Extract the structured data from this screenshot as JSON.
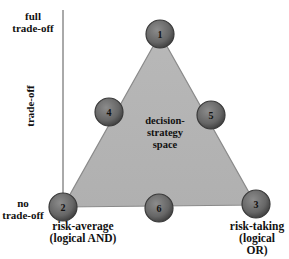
{
  "diagram": {
    "axis": {
      "label": "trade-off",
      "top_label": "full trade-off",
      "bottom_label": "no trade-off"
    },
    "region_label": [
      "decision-",
      "strategy",
      "space"
    ],
    "colors": {
      "triangle_fill": "#b3b3b3",
      "triangle_stroke": "#8a8a8a",
      "node_fill": "#6e6e6e",
      "node_stroke": "#3a3a3a",
      "axis_line": "#555555"
    },
    "nodes": [
      {
        "id": "1",
        "label": "1",
        "position": "top"
      },
      {
        "id": "2",
        "label": "2",
        "position": "bottom-left",
        "caption": [
          "risk-average",
          "(logical AND)"
        ]
      },
      {
        "id": "3",
        "label": "3",
        "position": "bottom-right",
        "caption": [
          "risk-taking",
          "(logical",
          "OR)"
        ]
      },
      {
        "id": "4",
        "label": "4",
        "position": "left-edge"
      },
      {
        "id": "5",
        "label": "5",
        "position": "right-edge"
      },
      {
        "id": "6",
        "label": "6",
        "position": "bottom-edge"
      }
    ],
    "top_label_lines": [
      "full",
      "trade-off"
    ],
    "bottom_label_lines": [
      "no",
      "trade-off"
    ]
  }
}
